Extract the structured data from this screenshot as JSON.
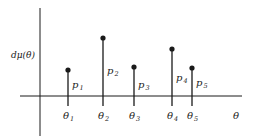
{
  "diagram": {
    "y_label": "dμ(θ)",
    "x_label": "θ",
    "colors": {
      "ink": "#1a1a1a",
      "background": "#ffffff"
    },
    "points": [
      {
        "theta_label": "θ",
        "theta_sub": "1",
        "p_label": "p",
        "p_sub": "1",
        "height_rank": 3
      },
      {
        "theta_label": "θ",
        "theta_sub": "2",
        "p_label": "p",
        "p_sub": "2",
        "height_rank": 1
      },
      {
        "theta_label": "θ",
        "theta_sub": "3",
        "p_label": "p",
        "p_sub": "3",
        "height_rank": 4
      },
      {
        "theta_label": "θ",
        "theta_sub": "4",
        "p_label": "p",
        "p_sub": "4",
        "height_rank": 2
      },
      {
        "theta_label": "θ",
        "theta_sub": "5",
        "p_label": "p",
        "p_sub": "5",
        "height_rank": 5
      }
    ]
  }
}
